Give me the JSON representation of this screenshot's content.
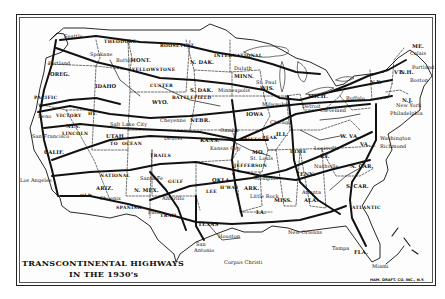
{
  "map": {
    "title_line1": "TRANSCONTINENTAL HIGHWAYS",
    "title_line2": "IN THE 1930's",
    "credit": "HAM. DRAFT. CO. INC., N.Y.",
    "colors": {
      "ink": "#111111",
      "paper": "#fdfdfd",
      "border": "#222222"
    },
    "states": [
      "ORE.",
      "IDAHO",
      "MONT.",
      "N. DAK.",
      "S. DAK.",
      "MINN.",
      "WIS.",
      "MICH.",
      "N.Y.",
      "VT.",
      "N.H.",
      "ME.",
      "NEV.",
      "CALIF.",
      "UTAH",
      "WYO.",
      "NEBR.",
      "KANS.",
      "IOWA",
      "ILL.",
      "MO.",
      "KY.",
      "W. VA.",
      "VA.",
      "N. CAR.",
      "S. CAR.",
      "TENN.",
      "OKLA.",
      "ARK.",
      "LA.",
      "MISS.",
      "ALA.",
      "ARIZ.",
      "N. MEX.",
      "TEXAS",
      "FLA.",
      "N.J."
    ],
    "cities": [
      "Seattle",
      "Portland",
      "Butte",
      "Spokane",
      "Duluth",
      "St. Paul",
      "Minneapolis",
      "Milwaukee",
      "Chicago",
      "Detroit",
      "Cleveland",
      "Buffalo",
      "New York",
      "Philadelphia",
      "Boston",
      "Portland ME",
      "Calais",
      "Washington",
      "Richmond",
      "Reno",
      "San Francisco",
      "Los Angeles",
      "Salt Lake City",
      "Cheyenne",
      "Denver",
      "Omaha",
      "Kansas City",
      "St. Louis",
      "Louisville",
      "Nashville",
      "Memphis",
      "Little Rock",
      "Atlanta",
      "Santa Fe",
      "Phoenix",
      "Amarillo",
      "El Paso",
      "San Antonio",
      "Houston",
      "Corpus Christi",
      "New Orleans",
      "Tampa",
      "Miami"
    ],
    "highways": [
      "THEODORE ROOSEVELT",
      "INTERNATIONAL",
      "YELLOWSTONE TRAIL",
      "CUSTER BATTLEFIELD",
      "VICTORY HWY",
      "LINCOLN",
      "OCEAN TO OCEAN",
      "PIKES PEAK",
      "NATIONAL OLD TRAILS",
      "OLD SPANISH TRAIL",
      "LEE HIGHWAY",
      "GULF",
      "DIXIE",
      "ATLANTIC",
      "PACIFIC HWY",
      "PIKES PEAK OCEAN TO OCEAN",
      "DIXIE HWY",
      "JEFFERSON"
    ]
  },
  "labels": {
    "seattle": "Seattle",
    "portland": "Portland",
    "oregon": "OREG.",
    "spokane": "Spokane",
    "idaho": "IDAHO",
    "butte": "Butte",
    "montana": "MONT.",
    "yellowstone": "YELLOWSTONE",
    "roosevelt": "THEODORE",
    "roosevelt2": "ROOSEVELT",
    "ndak": "N. DAK.",
    "sdak": "S. DAK.",
    "international": "INTERNATIONAL",
    "duluth": "Duluth",
    "minn": "MINN.",
    "stpaul": "St. Paul",
    "minneapolis": "Minneapolis",
    "wis": "WIS.",
    "milwaukee": "Milwaukee",
    "chicago": "Chicago",
    "ill": "ILL.",
    "detroit": "Detroit",
    "mich": "MICH.",
    "cleveland": "Cleveland",
    "buffalo": "Buffalo",
    "ny": "N.Y.",
    "newyork": "New York",
    "philadelphia": "Philadelphia",
    "nj": "N.J.",
    "boston": "Boston",
    "portlandme": "Portland",
    "me": "ME.",
    "calais": "Calais",
    "vt": "VT.",
    "nh": "N.H.",
    "washington": "Washington",
    "richmond": "Richmond",
    "wva": "W. VA.",
    "va": "VA.",
    "ncar": "N. CAR.",
    "scar": "S. CAR.",
    "louisville": "Louisville",
    "ky": "KY.",
    "nashville": "Nashville",
    "tenn": "TENN.",
    "memphis": "Memphis",
    "atlanta": "Atlanta",
    "ala": "ALA.",
    "miss": "MISS.",
    "ark": "ARK.",
    "littlerock": "Little Rock",
    "la": "LA.",
    "neworleans": "New Orleans",
    "tampa": "Tampa",
    "fla": "FLA.",
    "miami": "Miami",
    "houston": "Houston",
    "texas": "TEXAS",
    "sanantonio": "San",
    "sanantonio2": "Antonio",
    "corpus": "Corpus Christi",
    "elpaso": "Paso",
    "amarillo": "Amarillo",
    "okla": "OKLA.",
    "nmex": "N. MEX.",
    "santafe": "Santa Fe",
    "ariz": "ARIZ.",
    "phoenix": "Phoenix",
    "losangeles": "Los Angeles",
    "calif": "CALIF.",
    "sanfrancisco": "San Francisco",
    "reno": "Reno",
    "nev": "NEV.",
    "victory": "VICTORY",
    "hy": "HY.",
    "lincoln": "LINCOLN",
    "saltlake": "Salt Lake City",
    "utah": "UTAH",
    "to": "TO",
    "ocean": "OCEAN",
    "cheyenne": "Cheyenne",
    "nebr": "NEBR.",
    "omaha": "Omaha",
    "denver": "Denver",
    "kans": "KANS.",
    "kansascity": "Kansas City",
    "stlouis": "St. Louis",
    "mo": "MO.",
    "iowa": "IOWA",
    "national": "NATIONAL",
    "old": "OLD",
    "spanish": "SPANISH",
    "trail": "TRAIL",
    "lee": "LEE",
    "hway": "H'WAY",
    "pikes": "PIKES",
    "peak": "PEAK",
    "custer": "CUSTER",
    "battlefield": "BATTLEFIELD",
    "wyo": "WYO.",
    "gulf": "GULF",
    "dixie": "DIXIE",
    "atlantic": "ATLANTIC",
    "pacific": "PACIFIC",
    "trails": "TRAILS",
    "jefferson": "JEFFERSON"
  }
}
